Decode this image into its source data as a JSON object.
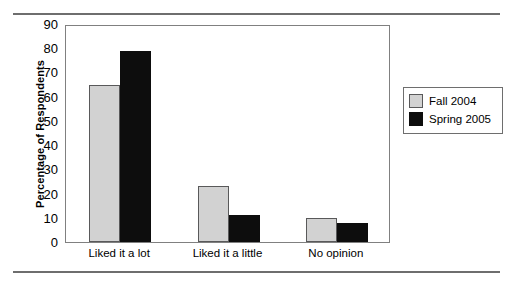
{
  "chart_data": {
    "type": "bar",
    "title": "",
    "subtitle": "",
    "xlabel": "",
    "ylabel": "Percentage of Respondents",
    "categories": [
      "Liked it a lot",
      "Liked it a little",
      "No opinion"
    ],
    "series": [
      {
        "name": "Fall 2004",
        "color": "#d2d2d2",
        "values": [
          65,
          23,
          10
        ]
      },
      {
        "name": "Spring 2005",
        "color": "#0d0d0d",
        "values": [
          79,
          11,
          8
        ]
      }
    ],
    "ylim": [
      0,
      90
    ],
    "ytick_values": [
      0,
      10,
      20,
      30,
      40,
      50,
      60,
      70,
      80,
      90
    ],
    "ytick_labels": [
      "0",
      "10",
      "20",
      "30",
      "40",
      "50",
      "60",
      "70",
      "80",
      "90"
    ],
    "grid": false,
    "legend_position": "right-outside",
    "legend_entries": [
      "Fall 2004",
      "Spring 2005"
    ]
  },
  "decor": {
    "rule_color": "#6e6e6e",
    "frame_color": "#808080"
  }
}
